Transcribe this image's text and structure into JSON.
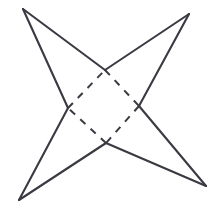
{
  "figure": {
    "background_color": "#ffffff",
    "stroke_color": "#3a3a42",
    "solid_stroke_width": 2.1,
    "dashed_stroke_width": 2.0,
    "dash_pattern": "7 7",
    "canvas": {
      "width": 220,
      "height": 208
    }
  },
  "chart_data": {
    "type": "diagram",
    "xlabel": "",
    "ylabel": "",
    "xlim": [
      0,
      220
    ],
    "ylim": [
      0,
      208
    ],
    "grid": false,
    "legend": "none",
    "outer_points": [
      {
        "name": "top-left-tip",
        "x": 23,
        "y": 9
      },
      {
        "name": "top-right-tip",
        "x": 189,
        "y": 14
      },
      {
        "name": "bottom-right-tip",
        "x": 206,
        "y": 186
      },
      {
        "name": "bottom-left-tip",
        "x": 19,
        "y": 200
      }
    ],
    "inner_points": [
      {
        "name": "inner-top",
        "x": 105,
        "y": 70
      },
      {
        "name": "inner-right",
        "x": 139,
        "y": 106
      },
      {
        "name": "inner-bottom",
        "x": 106,
        "y": 143
      },
      {
        "name": "inner-left",
        "x": 68,
        "y": 108
      }
    ],
    "solid_edges": [
      {
        "name": "edge-topleft-to-innertop",
        "x1": 23,
        "y1": 9,
        "x2": 105,
        "y2": 70
      },
      {
        "name": "edge-innertop-to-topright",
        "x1": 105,
        "y1": 70,
        "x2": 189,
        "y2": 14
      },
      {
        "name": "edge-topright-to-innerright",
        "x1": 189,
        "y1": 14,
        "x2": 139,
        "y2": 106
      },
      {
        "name": "edge-innerright-to-bottomright",
        "x1": 139,
        "y1": 106,
        "x2": 206,
        "y2": 186
      },
      {
        "name": "edge-bottomright-to-innerbottom",
        "x1": 206,
        "y1": 186,
        "x2": 106,
        "y2": 143
      },
      {
        "name": "edge-innerbottom-to-bottomleft",
        "x1": 106,
        "y1": 143,
        "x2": 19,
        "y2": 200
      },
      {
        "name": "edge-bottomleft-to-innerleft",
        "x1": 19,
        "y1": 200,
        "x2": 68,
        "y2": 108
      },
      {
        "name": "edge-innerleft-to-topleft",
        "x1": 68,
        "y1": 108,
        "x2": 23,
        "y2": 9
      }
    ],
    "dashed_edges": [
      {
        "name": "rhombus-top-right-side",
        "x1": 105,
        "y1": 70,
        "x2": 139,
        "y2": 106
      },
      {
        "name": "rhombus-bottom-right-side",
        "x1": 139,
        "y1": 106,
        "x2": 106,
        "y2": 143
      },
      {
        "name": "rhombus-bottom-left-side",
        "x1": 106,
        "y1": 143,
        "x2": 68,
        "y2": 108
      },
      {
        "name": "rhombus-top-left-side",
        "x1": 68,
        "y1": 108,
        "x2": 105,
        "y2": 70
      }
    ],
    "star_outline_path": "M 23 9 L 105 70 L 189 14 L 139 106 L 206 186 L 106 143 L 19 200 L 68 108 Z"
  }
}
